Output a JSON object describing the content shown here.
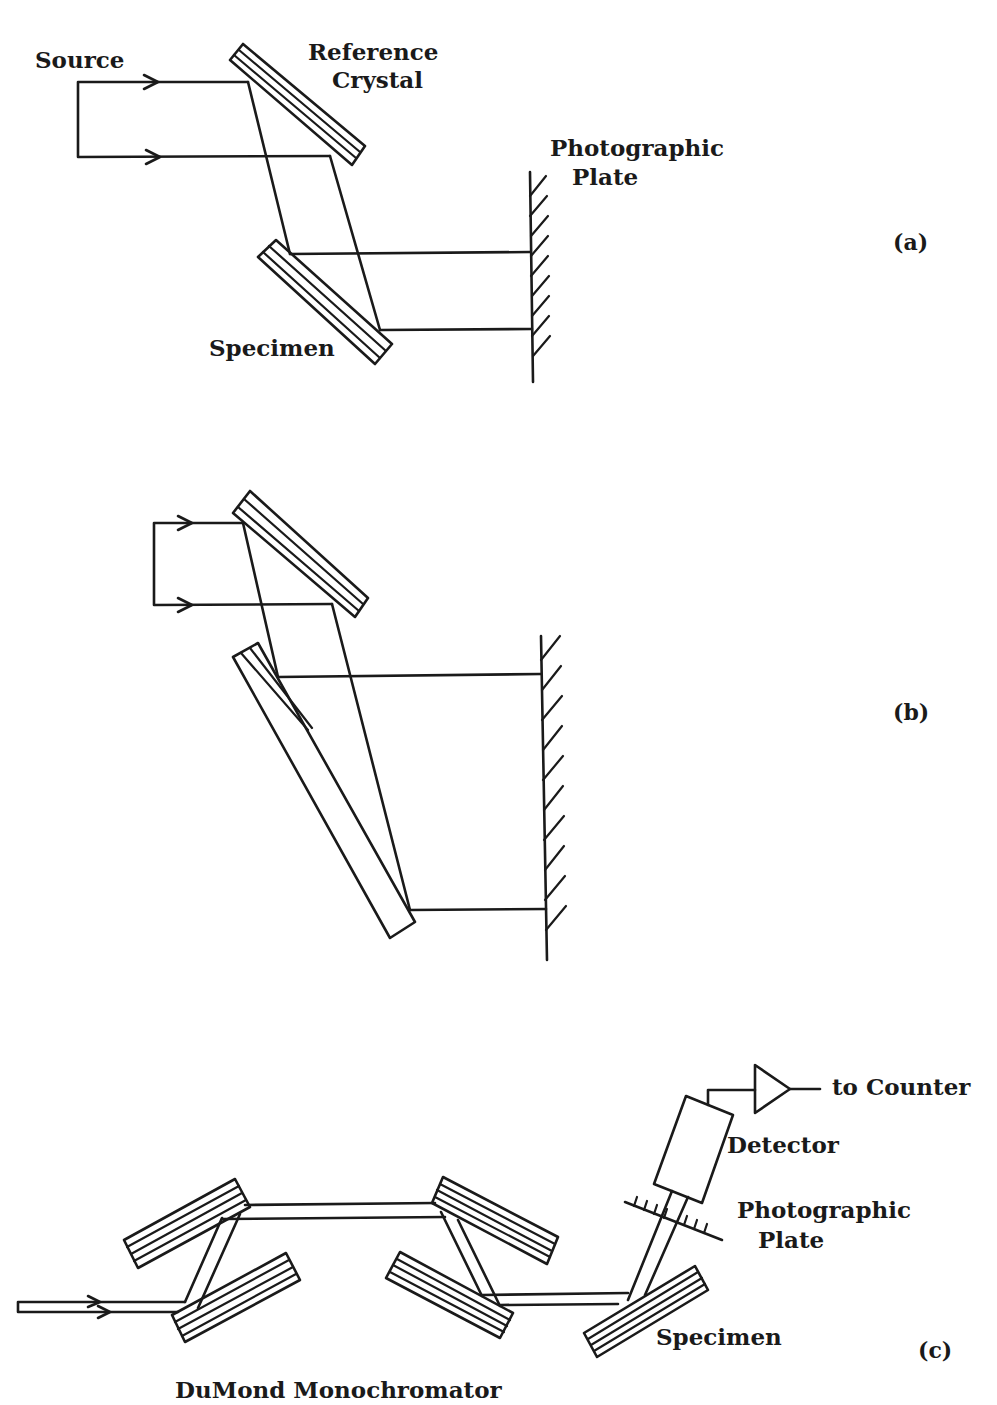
{
  "figure": {
    "panels": [
      {
        "id": "a",
        "tag": "(a)",
        "labels": {
          "source": "Source",
          "reference_line1": "Reference",
          "reference_line2": "Crystal",
          "plate_line1": "Photographic",
          "plate_line2": "Plate",
          "specimen": "Specimen"
        }
      },
      {
        "id": "b",
        "tag": "(b)",
        "labels": {}
      },
      {
        "id": "c",
        "tag": "(c)",
        "labels": {
          "counter": "to Counter",
          "detector": "Detector",
          "plate_line1": "Photographic",
          "plate_line2": "Plate",
          "specimen": "Specimen",
          "monochromator": "DuMond Monochromator"
        }
      }
    ]
  },
  "colors": {
    "ink": "#1a1a1a",
    "background": "#ffffff"
  }
}
